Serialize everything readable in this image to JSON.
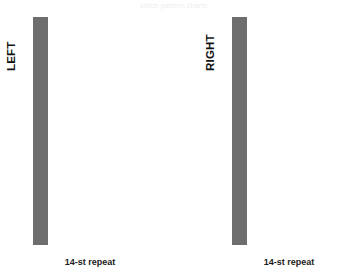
{
  "header": {
    "caption": "stitch pattern charts"
  },
  "colors": {
    "filled_cell": "#c3c3c3",
    "empty_cell": "#ffffff",
    "grid_line": "#6e6e6e",
    "text": "#111111"
  },
  "charts": [
    {
      "id": "left",
      "side_label": "LEFT",
      "repeat_label": "14-st repeat",
      "columns": 14,
      "rows": 29
    },
    {
      "id": "right",
      "side_label": "RIGHT",
      "repeat_label": "14-st repeat",
      "columns": 14,
      "rows": 29
    }
  ],
  "chart_data": [
    {
      "type": "heatmap",
      "title": "LEFT",
      "xlabel": "14-st repeat",
      "ylabel": "",
      "columns": 14,
      "rows": 29,
      "legend": {
        "1": "filled (knit/cable)",
        "0": "empty (purl)"
      },
      "grid": [
        [
          0,
          0,
          0,
          0,
          0,
          0,
          0,
          0,
          0,
          0,
          0,
          0,
          0,
          0
        ],
        [
          0,
          1,
          0,
          0,
          0,
          0,
          0,
          0,
          0,
          1,
          1,
          1,
          1,
          0
        ],
        [
          1,
          1,
          0,
          0,
          0,
          0,
          0,
          0,
          0,
          1,
          0,
          0,
          1,
          1
        ],
        [
          0,
          1,
          0,
          1,
          0,
          0,
          0,
          0,
          0,
          1,
          0,
          0,
          0,
          1
        ],
        [
          0,
          1,
          0,
          0,
          1,
          0,
          0,
          0,
          0,
          1,
          0,
          0,
          0,
          1
        ],
        [
          1,
          1,
          1,
          1,
          1,
          1,
          0,
          0,
          0,
          1,
          1,
          1,
          1,
          1
        ],
        [
          0,
          1,
          0,
          0,
          0,
          0,
          1,
          0,
          0,
          1,
          0,
          0,
          0,
          1
        ],
        [
          0,
          1,
          0,
          0,
          0,
          0,
          0,
          1,
          1,
          1,
          0,
          0,
          0,
          1
        ],
        [
          0,
          1,
          0,
          0,
          0,
          0,
          0,
          0,
          1,
          1,
          0,
          0,
          1,
          1
        ],
        [
          1,
          1,
          1,
          1,
          1,
          1,
          1,
          1,
          1,
          1,
          1,
          1,
          1,
          1
        ],
        [
          0,
          1,
          0,
          0,
          0,
          0,
          0,
          1,
          0,
          0,
          1,
          0,
          0,
          1
        ],
        [
          1,
          1,
          0,
          0,
          0,
          0,
          1,
          1,
          0,
          0,
          1,
          1,
          0,
          1
        ],
        [
          0,
          1,
          0,
          0,
          0,
          1,
          1,
          0,
          0,
          0,
          0,
          1,
          1,
          1
        ],
        [
          0,
          1,
          0,
          0,
          1,
          1,
          0,
          0,
          0,
          0,
          0,
          0,
          1,
          1
        ],
        [
          1,
          1,
          1,
          1,
          1,
          1,
          1,
          1,
          1,
          1,
          1,
          1,
          1,
          1
        ],
        [
          0,
          1,
          1,
          1,
          0,
          0,
          0,
          0,
          0,
          0,
          0,
          0,
          0,
          1
        ],
        [
          0,
          1,
          0,
          1,
          1,
          0,
          0,
          0,
          0,
          0,
          0,
          0,
          0,
          1
        ],
        [
          1,
          1,
          0,
          0,
          1,
          1,
          0,
          0,
          0,
          0,
          0,
          0,
          1,
          1
        ],
        [
          0,
          1,
          0,
          0,
          0,
          1,
          1,
          0,
          0,
          0,
          0,
          1,
          1,
          0
        ],
        [
          1,
          1,
          1,
          1,
          1,
          1,
          1,
          1,
          1,
          1,
          1,
          1,
          1,
          1
        ],
        [
          0,
          1,
          0,
          0,
          0,
          0,
          0,
          1,
          1,
          0,
          0,
          0,
          0,
          1
        ],
        [
          0,
          1,
          0,
          0,
          0,
          0,
          0,
          0,
          1,
          1,
          0,
          0,
          0,
          1
        ],
        [
          1,
          1,
          0,
          0,
          0,
          0,
          0,
          0,
          0,
          1,
          1,
          0,
          0,
          1
        ],
        [
          0,
          1,
          0,
          0,
          0,
          0,
          0,
          0,
          0,
          0,
          1,
          1,
          0,
          1
        ],
        [
          0,
          1,
          1,
          1,
          1,
          1,
          1,
          1,
          1,
          1,
          1,
          1,
          1,
          1
        ],
        [
          0,
          1,
          0,
          0,
          0,
          0,
          0,
          0,
          0,
          0,
          0,
          1,
          0,
          1
        ],
        [
          1,
          1,
          0,
          0,
          0,
          1,
          0,
          0,
          0,
          1,
          0,
          0,
          1,
          1
        ],
        [
          0,
          0,
          0,
          0,
          0,
          1,
          0,
          0,
          1,
          1,
          0,
          0,
          1,
          1
        ],
        [
          0,
          0,
          0,
          0,
          0,
          0,
          0,
          0,
          0,
          0,
          0,
          0,
          0,
          0
        ]
      ]
    },
    {
      "type": "heatmap",
      "title": "RIGHT",
      "xlabel": "14-st repeat",
      "ylabel": "",
      "columns": 14,
      "rows": 29,
      "legend": {
        "1": "filled (knit/cable)",
        "0": "empty (purl)"
      },
      "grid": [
        [
          0,
          0,
          0,
          0,
          0,
          0,
          0,
          0,
          0,
          0,
          0,
          0,
          0,
          0
        ],
        [
          0,
          1,
          1,
          1,
          1,
          0,
          0,
          0,
          0,
          0,
          0,
          1,
          0,
          0
        ],
        [
          1,
          1,
          0,
          0,
          1,
          1,
          0,
          0,
          0,
          0,
          0,
          1,
          1,
          0
        ],
        [
          1,
          0,
          0,
          0,
          0,
          1,
          1,
          0,
          0,
          0,
          0,
          1,
          0,
          1
        ],
        [
          1,
          0,
          0,
          0,
          0,
          0,
          1,
          1,
          0,
          0,
          0,
          1,
          0,
          0
        ],
        [
          1,
          1,
          1,
          1,
          1,
          1,
          1,
          1,
          1,
          1,
          1,
          1,
          1,
          0
        ],
        [
          1,
          0,
          0,
          0,
          0,
          0,
          0,
          0,
          1,
          0,
          0,
          1,
          0,
          0
        ],
        [
          1,
          0,
          0,
          1,
          1,
          0,
          0,
          0,
          0,
          1,
          0,
          1,
          0,
          0
        ],
        [
          1,
          1,
          0,
          0,
          1,
          1,
          0,
          0,
          0,
          0,
          1,
          1,
          0,
          0
        ],
        [
          1,
          1,
          1,
          1,
          1,
          1,
          1,
          1,
          1,
          1,
          1,
          1,
          1,
          1
        ],
        [
          1,
          0,
          0,
          0,
          0,
          0,
          1,
          1,
          0,
          0,
          0,
          1,
          0,
          0
        ],
        [
          1,
          0,
          0,
          0,
          0,
          0,
          0,
          1,
          1,
          0,
          0,
          1,
          1,
          0
        ],
        [
          1,
          1,
          0,
          0,
          0,
          0,
          0,
          0,
          1,
          1,
          0,
          0,
          1,
          1
        ],
        [
          1,
          0,
          0,
          0,
          0,
          0,
          0,
          0,
          0,
          1,
          1,
          0,
          0,
          1
        ],
        [
          1,
          1,
          1,
          1,
          1,
          1,
          1,
          1,
          1,
          1,
          1,
          1,
          1,
          1
        ],
        [
          1,
          0,
          0,
          0,
          0,
          0,
          0,
          0,
          0,
          0,
          1,
          1,
          1,
          0
        ],
        [
          1,
          0,
          0,
          0,
          0,
          0,
          0,
          0,
          0,
          1,
          1,
          0,
          1,
          0
        ],
        [
          1,
          1,
          0,
          0,
          0,
          0,
          0,
          0,
          1,
          1,
          0,
          0,
          1,
          1
        ],
        [
          0,
          1,
          1,
          0,
          0,
          0,
          0,
          1,
          1,
          0,
          0,
          0,
          1,
          0
        ],
        [
          1,
          1,
          1,
          1,
          1,
          1,
          1,
          1,
          1,
          1,
          1,
          1,
          1,
          1
        ],
        [
          1,
          0,
          0,
          0,
          0,
          1,
          1,
          0,
          0,
          0,
          0,
          0,
          1,
          0
        ],
        [
          1,
          0,
          0,
          0,
          1,
          1,
          0,
          0,
          0,
          0,
          0,
          0,
          1,
          0
        ],
        [
          1,
          0,
          0,
          1,
          1,
          0,
          0,
          0,
          0,
          0,
          0,
          1,
          1,
          0
        ],
        [
          1,
          0,
          1,
          1,
          0,
          0,
          0,
          0,
          0,
          0,
          0,
          0,
          1,
          0
        ],
        [
          1,
          1,
          1,
          1,
          1,
          1,
          1,
          1,
          1,
          1,
          1,
          1,
          1,
          0
        ],
        [
          1,
          0,
          1,
          0,
          0,
          0,
          0,
          0,
          0,
          0,
          0,
          0,
          1,
          0
        ],
        [
          1,
          1,
          0,
          0,
          1,
          0,
          0,
          0,
          1,
          0,
          0,
          0,
          1,
          1
        ],
        [
          1,
          1,
          0,
          0,
          1,
          1,
          0,
          0,
          0,
          0,
          0,
          0,
          0,
          1
        ],
        [
          0,
          0,
          0,
          0,
          0,
          0,
          0,
          0,
          0,
          0,
          0,
          0,
          0,
          0
        ]
      ]
    }
  ]
}
